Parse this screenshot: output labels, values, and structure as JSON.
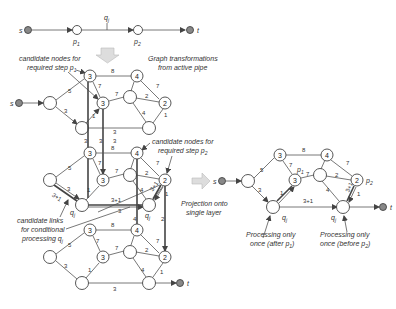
{
  "top_chain": {
    "source": "s",
    "sink": "t",
    "required_step_1": "p",
    "required_step_1_sub": "1",
    "required_step_2": "p",
    "required_step_2_sub": "2",
    "conditional": "q",
    "conditional_sub": "j"
  },
  "annotations": {
    "graph_transform_line1": "Graph transformations",
    "graph_transform_line2": "from active pipe",
    "candidate_p1_line1": "candidate nodes for",
    "candidate_p1_line2": "required step p",
    "candidate_p1_sub": "1",
    "candidate_p2_line1": "candidate nodes for",
    "candidate_p2_line2": "required step p",
    "candidate_p2_sub": "2",
    "candidate_links_line1": "candidate links",
    "candidate_links_line2": "for conditional",
    "candidate_links_line3": "processing q",
    "candidate_links_sub": "j",
    "projection_line1": "Projection onto",
    "projection_line2": "single layer",
    "once_after_line1": "Processing only",
    "once_after_line2": "once (after p",
    "once_after_sub": "1",
    "once_after_close": ")",
    "once_before_line1": "Processing only",
    "once_before_line2": "once (before p",
    "once_before_sub": "2",
    "once_before_close": ")"
  },
  "graph": {
    "node_labels": {
      "n3a": "3",
      "n4": "4",
      "n3b": "3",
      "n2": "2"
    },
    "edge_weights": {
      "n3a_n4": "8",
      "left_n3a": "5",
      "n3a_n3b": "7",
      "n3b_mid": "7",
      "mid_n2": "2",
      "n4_n2": "7",
      "left_bot1": "3",
      "bot1_n3b": "1",
      "bot1_bot2": "3",
      "mid_bot2": "4",
      "n2_bot2": "1",
      "vertical_1": "3",
      "vertical_2": "3",
      "vertical_3": "4",
      "vertical_4": "2",
      "q_link": "3+1",
      "q_link_diag_left": "3+1",
      "q_link_diag_right": "3+1"
    },
    "q_label": "q",
    "q_sub": "j"
  },
  "right_graph": {
    "source": "s",
    "sink": "t",
    "p1_label": "p",
    "p1_sub": "1",
    "p2_label": "p",
    "p2_sub": "2",
    "bottom_link": "3+1"
  }
}
